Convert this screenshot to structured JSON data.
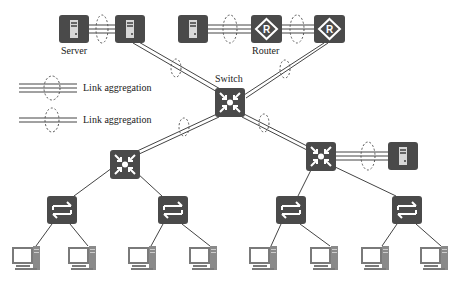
{
  "colors": {
    "device": "#4a4a4a",
    "device_glyph": "#ffffff",
    "pc": "#7a7a7a",
    "link": "#444444",
    "ellipse": "#555555",
    "text": "#222222"
  },
  "labels": {
    "server": "Server",
    "router": "Router",
    "switch": "Switch",
    "legend_3": "Link aggregation",
    "legend_2": "Link aggregation"
  },
  "devices": {
    "servers": [
      {
        "id": "server-1",
        "x": 59,
        "y": 15
      },
      {
        "id": "server-2",
        "x": 115,
        "y": 15
      },
      {
        "id": "server-3",
        "x": 178,
        "y": 15
      },
      {
        "id": "server-4",
        "x": 388,
        "y": 142
      }
    ],
    "routers": [
      {
        "id": "router-1",
        "x": 251,
        "y": 15
      },
      {
        "id": "router-2",
        "x": 314,
        "y": 15
      }
    ],
    "core_switches": [
      {
        "id": "core-switch",
        "x": 215,
        "y": 88
      },
      {
        "id": "dist-switch-left",
        "x": 110,
        "y": 150
      },
      {
        "id": "dist-switch-right",
        "x": 306,
        "y": 142
      }
    ],
    "access_switches": [
      {
        "id": "access-1",
        "x": 47,
        "y": 196
      },
      {
        "id": "access-2",
        "x": 158,
        "y": 196
      },
      {
        "id": "access-3",
        "x": 276,
        "y": 196
      },
      {
        "id": "access-4",
        "x": 392,
        "y": 196
      }
    ],
    "pcs": [
      {
        "id": "pc-1",
        "x": 13,
        "y": 246
      },
      {
        "id": "pc-2",
        "x": 69,
        "y": 246
      },
      {
        "id": "pc-3",
        "x": 129,
        "y": 246
      },
      {
        "id": "pc-4",
        "x": 190,
        "y": 246
      },
      {
        "id": "pc-5",
        "x": 250,
        "y": 246
      },
      {
        "id": "pc-6",
        "x": 311,
        "y": 246
      },
      {
        "id": "pc-7",
        "x": 362,
        "y": 246
      },
      {
        "id": "pc-8",
        "x": 421,
        "y": 246
      }
    ]
  }
}
